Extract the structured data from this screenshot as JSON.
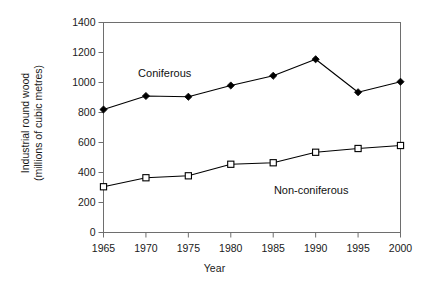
{
  "chart_data": {
    "type": "line",
    "title": "",
    "xlabel": "Year",
    "ylabel": "Industrial round wood (millions of cubic metres)",
    "ylabel_line1": "Industrial round wood",
    "ylabel_line2": "(millions of cubic metres)",
    "categories": [
      "1965",
      "1970",
      "1975",
      "1980",
      "1985",
      "1990",
      "1995",
      "2000"
    ],
    "x": [
      1965,
      1970,
      1975,
      1980,
      1985,
      1990,
      1995,
      2000
    ],
    "xlim": [
      1965,
      2000
    ],
    "ylim": [
      0,
      1400
    ],
    "yticks": [
      0,
      200,
      400,
      600,
      800,
      1000,
      1200,
      1400
    ],
    "ytick_labels": [
      "0",
      "200",
      "400",
      "600",
      "800",
      "1000",
      "1200",
      "1400"
    ],
    "grid": false,
    "legend_position": "inline-annotations",
    "series": [
      {
        "name": "Coniferous",
        "marker": "filled-diamond",
        "color": "#000000",
        "values": [
          820,
          910,
          905,
          980,
          1045,
          1155,
          935,
          1005
        ],
        "annotation": {
          "text": "Coniferous",
          "x": 1972.2,
          "y": 1055
        }
      },
      {
        "name": "Non-coniferous",
        "marker": "open-square",
        "color": "#000000",
        "values": [
          305,
          365,
          378,
          455,
          465,
          535,
          560,
          580
        ],
        "annotation": {
          "text": "Non-coniferous",
          "x": 1989.5,
          "y": 275
        }
      }
    ]
  },
  "axes": {
    "frame_color": "#6e6e6e",
    "tick_color": "#6e6e6e"
  }
}
